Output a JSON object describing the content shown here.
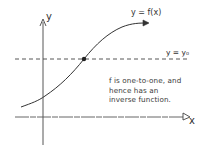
{
  "diagram": {
    "type": "function-graph",
    "axes": {
      "x_label": "x",
      "y_label": "y"
    },
    "curve_label": "y = f(x)",
    "horizontal_line_label": "y = y₀",
    "note_lines": [
      "f is one-to-one, and",
      "hence has an",
      "inverse function."
    ],
    "colors": {
      "ink": "#333333",
      "background": "#ffffff"
    }
  }
}
